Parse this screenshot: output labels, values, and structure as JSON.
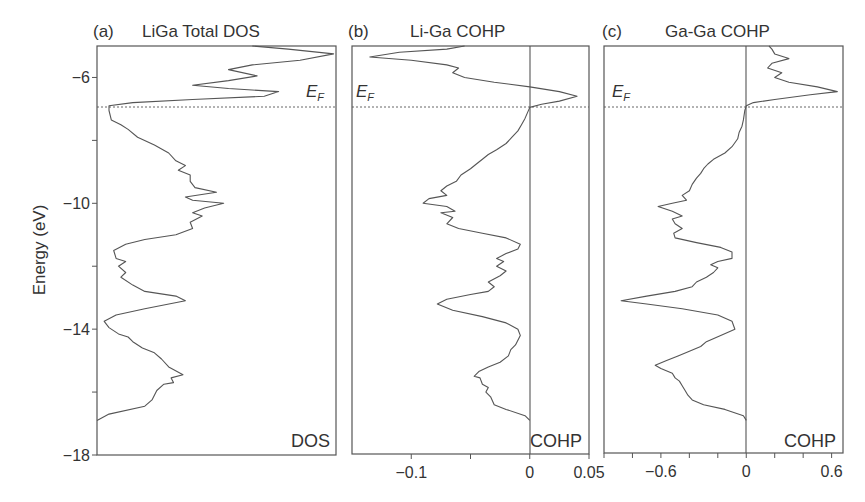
{
  "figure": {
    "ylabel": "Energy (eV)",
    "ef_label": "E",
    "ef_sub": "F",
    "ef_energy": -6.9
  },
  "chart_data": [
    {
      "type": "line",
      "panel": "(a)",
      "title": "LiGa Total DOS",
      "corner_label": "DOS",
      "xlabel": "",
      "ylabel": "Energy (eV)",
      "ylim": [
        -18,
        -5
      ],
      "yticks": [
        -6,
        -8,
        -10,
        -12,
        -14,
        -16,
        -18
      ],
      "ytick_labels": [
        "-6",
        "",
        "-10",
        "",
        "-14",
        "",
        "-18"
      ],
      "xlim": [
        0,
        1
      ],
      "xticks": [],
      "fermi_level": -6.9,
      "points_xy_normalized": [
        [
          0.0,
          -16.9
        ],
        [
          0.05,
          -16.7
        ],
        [
          0.2,
          -16.45
        ],
        [
          0.23,
          -16.25
        ],
        [
          0.25,
          -15.95
        ],
        [
          0.28,
          -15.75
        ],
        [
          0.32,
          -15.7
        ],
        [
          0.31,
          -15.55
        ],
        [
          0.36,
          -15.45
        ],
        [
          0.3,
          -15.2
        ],
        [
          0.27,
          -14.95
        ],
        [
          0.24,
          -14.75
        ],
        [
          0.19,
          -14.6
        ],
        [
          0.15,
          -14.4
        ],
        [
          0.13,
          -14.25
        ],
        [
          0.09,
          -14.15
        ],
        [
          0.05,
          -13.95
        ],
        [
          0.03,
          -13.75
        ],
        [
          0.08,
          -13.55
        ],
        [
          0.2,
          -13.35
        ],
        [
          0.37,
          -13.1
        ],
        [
          0.33,
          -12.95
        ],
        [
          0.2,
          -12.8
        ],
        [
          0.15,
          -12.6
        ],
        [
          0.1,
          -12.35
        ],
        [
          0.12,
          -12.2
        ],
        [
          0.09,
          -12.0
        ],
        [
          0.12,
          -11.85
        ],
        [
          0.08,
          -11.75
        ],
        [
          0.07,
          -11.5
        ],
        [
          0.12,
          -11.3
        ],
        [
          0.2,
          -11.15
        ],
        [
          0.33,
          -11.0
        ],
        [
          0.4,
          -10.8
        ],
        [
          0.39,
          -10.6
        ],
        [
          0.44,
          -10.4
        ],
        [
          0.4,
          -10.3
        ],
        [
          0.45,
          -10.15
        ],
        [
          0.53,
          -10.0
        ],
        [
          0.4,
          -9.9
        ],
        [
          0.37,
          -9.8
        ],
        [
          0.5,
          -9.65
        ],
        [
          0.41,
          -9.5
        ],
        [
          0.39,
          -9.3
        ],
        [
          0.39,
          -9.1
        ],
        [
          0.34,
          -8.95
        ],
        [
          0.37,
          -8.8
        ],
        [
          0.33,
          -8.65
        ],
        [
          0.3,
          -8.4
        ],
        [
          0.24,
          -8.15
        ],
        [
          0.17,
          -7.9
        ],
        [
          0.13,
          -7.65
        ],
        [
          0.1,
          -7.5
        ],
        [
          0.06,
          -7.35
        ],
        [
          0.05,
          -7.05
        ],
        [
          0.05,
          -6.9
        ],
        [
          0.15,
          -6.8
        ],
        [
          0.4,
          -6.7
        ],
        [
          0.7,
          -6.6
        ],
        [
          0.76,
          -6.45
        ],
        [
          0.55,
          -6.35
        ],
        [
          0.4,
          -6.25
        ],
        [
          0.55,
          -6.1
        ],
        [
          0.67,
          -5.95
        ],
        [
          0.55,
          -5.75
        ],
        [
          0.65,
          -5.6
        ],
        [
          0.85,
          -5.45
        ],
        [
          0.99,
          -5.25
        ],
        [
          0.8,
          -5.1
        ],
        [
          0.65,
          -5.0
        ]
      ]
    },
    {
      "type": "line",
      "panel": "(b)",
      "title": "Li-Ga COHP",
      "corner_label": "COHP",
      "ylim": [
        -18,
        -5
      ],
      "xlim": [
        -0.15,
        0.05
      ],
      "xticks": [
        -0.1,
        -0.05,
        0,
        0.05
      ],
      "xtick_labels": [
        "-0.1",
        "",
        "0",
        "0.05"
      ],
      "fermi_level": -6.9,
      "points": [
        [
          0.0,
          -16.9
        ],
        [
          -0.004,
          -16.75
        ],
        [
          -0.02,
          -16.55
        ],
        [
          -0.03,
          -16.4
        ],
        [
          -0.033,
          -16.15
        ],
        [
          -0.037,
          -16.0
        ],
        [
          -0.035,
          -15.85
        ],
        [
          -0.04,
          -15.75
        ],
        [
          -0.042,
          -15.55
        ],
        [
          -0.047,
          -15.5
        ],
        [
          -0.043,
          -15.35
        ],
        [
          -0.035,
          -15.2
        ],
        [
          -0.025,
          -15.05
        ],
        [
          -0.018,
          -14.85
        ],
        [
          -0.016,
          -14.65
        ],
        [
          -0.012,
          -14.5
        ],
        [
          -0.008,
          -14.2
        ],
        [
          -0.01,
          -14.0
        ],
        [
          -0.02,
          -13.8
        ],
        [
          -0.04,
          -13.6
        ],
        [
          -0.065,
          -13.4
        ],
        [
          -0.078,
          -13.2
        ],
        [
          -0.07,
          -13.05
        ],
        [
          -0.05,
          -12.9
        ],
        [
          -0.035,
          -12.8
        ],
        [
          -0.03,
          -12.65
        ],
        [
          -0.035,
          -12.5
        ],
        [
          -0.025,
          -12.3
        ],
        [
          -0.02,
          -12.15
        ],
        [
          -0.028,
          -12.0
        ],
        [
          -0.022,
          -11.85
        ],
        [
          -0.028,
          -11.75
        ],
        [
          -0.02,
          -11.6
        ],
        [
          -0.01,
          -11.45
        ],
        [
          -0.008,
          -11.3
        ],
        [
          -0.02,
          -11.1
        ],
        [
          -0.04,
          -10.95
        ],
        [
          -0.06,
          -10.8
        ],
        [
          -0.07,
          -10.65
        ],
        [
          -0.065,
          -10.45
        ],
        [
          -0.075,
          -10.3
        ],
        [
          -0.063,
          -10.25
        ],
        [
          -0.07,
          -10.1
        ],
        [
          -0.09,
          -10.0
        ],
        [
          -0.085,
          -9.85
        ],
        [
          -0.07,
          -9.75
        ],
        [
          -0.075,
          -9.6
        ],
        [
          -0.07,
          -9.45
        ],
        [
          -0.062,
          -9.3
        ],
        [
          -0.058,
          -9.1
        ],
        [
          -0.05,
          -8.9
        ],
        [
          -0.045,
          -8.75
        ],
        [
          -0.04,
          -8.6
        ],
        [
          -0.035,
          -8.45
        ],
        [
          -0.028,
          -8.3
        ],
        [
          -0.02,
          -8.1
        ],
        [
          -0.015,
          -7.9
        ],
        [
          -0.01,
          -7.7
        ],
        [
          -0.007,
          -7.5
        ],
        [
          -0.004,
          -7.3
        ],
        [
          0.0,
          -6.95
        ],
        [
          0.01,
          -6.85
        ],
        [
          0.025,
          -6.75
        ],
        [
          0.04,
          -6.6
        ],
        [
          0.025,
          -6.45
        ],
        [
          0.0,
          -6.3
        ],
        [
          -0.03,
          -6.15
        ],
        [
          -0.055,
          -6.0
        ],
        [
          -0.065,
          -5.85
        ],
        [
          -0.06,
          -5.7
        ],
        [
          -0.07,
          -5.6
        ],
        [
          -0.1,
          -5.45
        ],
        [
          -0.135,
          -5.35
        ],
        [
          -0.11,
          -5.2
        ],
        [
          -0.07,
          -5.1
        ],
        [
          -0.055,
          -5.0
        ]
      ]
    },
    {
      "type": "line",
      "panel": "(c)",
      "title": "Ga-Ga COHP",
      "corner_label": "COHP",
      "ylim": [
        -18,
        -5
      ],
      "xlim": [
        -1.0,
        0.68
      ],
      "xticks": [
        -1.0,
        -0.8,
        -0.6,
        -0.4,
        -0.2,
        0,
        0.2,
        0.4,
        0.6
      ],
      "xtick_labels": [
        "",
        "",
        "-0.6",
        "",
        "",
        "0",
        "",
        "",
        "0.6"
      ],
      "fermi_level": -6.9,
      "points": [
        [
          0.0,
          -16.9
        ],
        [
          -0.02,
          -16.75
        ],
        [
          -0.15,
          -16.55
        ],
        [
          -0.3,
          -16.4
        ],
        [
          -0.38,
          -16.25
        ],
        [
          -0.41,
          -16.1
        ],
        [
          -0.43,
          -15.95
        ],
        [
          -0.45,
          -15.8
        ],
        [
          -0.47,
          -15.65
        ],
        [
          -0.5,
          -15.55
        ],
        [
          -0.52,
          -15.4
        ],
        [
          -0.6,
          -15.25
        ],
        [
          -0.64,
          -15.15
        ],
        [
          -0.56,
          -15.0
        ],
        [
          -0.48,
          -14.85
        ],
        [
          -0.4,
          -14.7
        ],
        [
          -0.32,
          -14.55
        ],
        [
          -0.28,
          -14.4
        ],
        [
          -0.18,
          -14.2
        ],
        [
          -0.08,
          -14.0
        ],
        [
          -0.1,
          -13.75
        ],
        [
          -0.2,
          -13.55
        ],
        [
          -0.45,
          -13.35
        ],
        [
          -0.7,
          -13.2
        ],
        [
          -0.88,
          -13.1
        ],
        [
          -0.7,
          -12.95
        ],
        [
          -0.5,
          -12.8
        ],
        [
          -0.38,
          -12.65
        ],
        [
          -0.35,
          -12.5
        ],
        [
          -0.28,
          -12.35
        ],
        [
          -0.23,
          -12.2
        ],
        [
          -0.2,
          -12.05
        ],
        [
          -0.25,
          -11.95
        ],
        [
          -0.2,
          -11.85
        ],
        [
          -0.1,
          -11.75
        ],
        [
          -0.1,
          -11.55
        ],
        [
          -0.18,
          -11.4
        ],
        [
          -0.35,
          -11.25
        ],
        [
          -0.5,
          -11.1
        ],
        [
          -0.51,
          -10.95
        ],
        [
          -0.45,
          -10.8
        ],
        [
          -0.5,
          -10.65
        ],
        [
          -0.52,
          -10.5
        ],
        [
          -0.45,
          -10.4
        ],
        [
          -0.52,
          -10.25
        ],
        [
          -0.62,
          -10.1
        ],
        [
          -0.52,
          -10.0
        ],
        [
          -0.42,
          -9.9
        ],
        [
          -0.45,
          -9.75
        ],
        [
          -0.4,
          -9.6
        ],
        [
          -0.38,
          -9.4
        ],
        [
          -0.35,
          -9.2
        ],
        [
          -0.32,
          -9.05
        ],
        [
          -0.3,
          -8.9
        ],
        [
          -0.27,
          -8.75
        ],
        [
          -0.23,
          -8.6
        ],
        [
          -0.15,
          -8.4
        ],
        [
          -0.1,
          -8.2
        ],
        [
          -0.06,
          -7.95
        ],
        [
          -0.05,
          -7.75
        ],
        [
          -0.03,
          -7.55
        ],
        [
          -0.02,
          -7.35
        ],
        [
          -0.01,
          -7.05
        ],
        [
          0.0,
          -6.9
        ],
        [
          0.05,
          -6.8
        ],
        [
          0.2,
          -6.7
        ],
        [
          0.45,
          -6.55
        ],
        [
          0.64,
          -6.45
        ],
        [
          0.5,
          -6.3
        ],
        [
          0.3,
          -6.15
        ],
        [
          0.2,
          -6.0
        ],
        [
          0.25,
          -5.85
        ],
        [
          0.15,
          -5.7
        ],
        [
          0.18,
          -5.55
        ],
        [
          0.3,
          -5.4
        ],
        [
          0.2,
          -5.25
        ],
        [
          0.18,
          -5.1
        ],
        [
          0.16,
          -5.0
        ]
      ]
    }
  ]
}
